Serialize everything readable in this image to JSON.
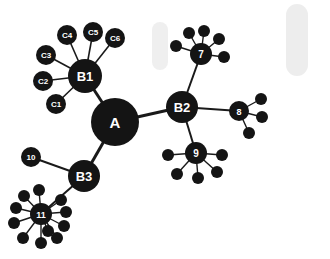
{
  "diagram": {
    "background_color": "#ffffff",
    "node_color": "#141414",
    "edge_color": "#1a1a1a",
    "label_color": "#ffffff"
  },
  "chart_data": {
    "type": "scatter",
    "title": "",
    "xlabel": "",
    "ylabel": "",
    "layout": "radial force-directed tree",
    "grid": false,
    "legend": "none",
    "xlim": [
      0,
      330
    ],
    "ylim": [
      0,
      259
    ],
    "nodes": [
      {
        "id": "A",
        "label": "A",
        "x": 115,
        "y": 122,
        "r": 24,
        "font": 15,
        "kind": "hub"
      },
      {
        "id": "B1",
        "label": "B1",
        "x": 85,
        "y": 76,
        "r": 17,
        "font": 13,
        "kind": "branch"
      },
      {
        "id": "B2",
        "label": "B2",
        "x": 182,
        "y": 107,
        "r": 16,
        "font": 13,
        "kind": "branch"
      },
      {
        "id": "B3",
        "label": "B3",
        "x": 84,
        "y": 176,
        "r": 16,
        "font": 13,
        "kind": "branch"
      },
      {
        "id": "C1",
        "label": "C1",
        "x": 56,
        "y": 104,
        "r": 10,
        "font": 8,
        "kind": "leaf-labeled"
      },
      {
        "id": "C2",
        "label": "C2",
        "x": 43,
        "y": 81,
        "r": 10,
        "font": 8,
        "kind": "leaf-labeled"
      },
      {
        "id": "C3",
        "label": "C3",
        "x": 46,
        "y": 55,
        "r": 10,
        "font": 8,
        "kind": "leaf-labeled"
      },
      {
        "id": "C4",
        "label": "C4",
        "x": 67,
        "y": 35,
        "r": 10,
        "font": 8,
        "kind": "leaf-labeled"
      },
      {
        "id": "C5",
        "label": "C5",
        "x": 93,
        "y": 32,
        "r": 10,
        "font": 8,
        "kind": "leaf-labeled"
      },
      {
        "id": "C6",
        "label": "C6",
        "x": 115,
        "y": 38,
        "r": 10,
        "font": 8,
        "kind": "leaf-labeled"
      },
      {
        "id": "N7",
        "label": "7",
        "x": 201,
        "y": 54,
        "r": 11,
        "font": 10,
        "kind": "leaf-labeled"
      },
      {
        "id": "N8",
        "label": "8",
        "x": 239,
        "y": 111,
        "r": 10,
        "font": 9,
        "kind": "leaf-labeled"
      },
      {
        "id": "N9",
        "label": "9",
        "x": 196,
        "y": 153,
        "r": 11,
        "font": 10,
        "kind": "leaf-labeled"
      },
      {
        "id": "N10",
        "label": "10",
        "x": 31,
        "y": 157,
        "r": 10,
        "font": 8,
        "kind": "leaf-labeled"
      },
      {
        "id": "N11",
        "label": "11",
        "x": 41,
        "y": 214,
        "r": 11,
        "font": 9,
        "kind": "leaf-labeled"
      },
      {
        "id": "L7a",
        "label": "",
        "x": 189,
        "y": 33,
        "r": 6,
        "font": 0,
        "kind": "leaf-dot"
      },
      {
        "id": "L7b",
        "label": "",
        "x": 204,
        "y": 31,
        "r": 6,
        "font": 0,
        "kind": "leaf-dot"
      },
      {
        "id": "L7c",
        "label": "",
        "x": 219,
        "y": 39,
        "r": 6,
        "font": 0,
        "kind": "leaf-dot"
      },
      {
        "id": "L7d",
        "label": "",
        "x": 176,
        "y": 46,
        "r": 6,
        "font": 0,
        "kind": "leaf-dot"
      },
      {
        "id": "L7e",
        "label": "",
        "x": 224,
        "y": 57,
        "r": 6,
        "font": 0,
        "kind": "leaf-dot"
      },
      {
        "id": "L8a",
        "label": "",
        "x": 261,
        "y": 99,
        "r": 6,
        "font": 0,
        "kind": "leaf-dot"
      },
      {
        "id": "L8b",
        "label": "",
        "x": 262,
        "y": 117,
        "r": 6,
        "font": 0,
        "kind": "leaf-dot"
      },
      {
        "id": "L8c",
        "label": "",
        "x": 249,
        "y": 133,
        "r": 6,
        "font": 0,
        "kind": "leaf-dot"
      },
      {
        "id": "L9a",
        "label": "",
        "x": 168,
        "y": 155,
        "r": 6,
        "font": 0,
        "kind": "leaf-dot"
      },
      {
        "id": "L9b",
        "label": "",
        "x": 222,
        "y": 155,
        "r": 6,
        "font": 0,
        "kind": "leaf-dot"
      },
      {
        "id": "L9c",
        "label": "",
        "x": 177,
        "y": 174,
        "r": 6,
        "font": 0,
        "kind": "leaf-dot"
      },
      {
        "id": "L9d",
        "label": "",
        "x": 198,
        "y": 178,
        "r": 6,
        "font": 0,
        "kind": "leaf-dot"
      },
      {
        "id": "L9e",
        "label": "",
        "x": 217,
        "y": 172,
        "r": 6,
        "font": 0,
        "kind": "leaf-dot"
      },
      {
        "id": "L11a",
        "label": "",
        "x": 24,
        "y": 196,
        "r": 6,
        "font": 0,
        "kind": "leaf-dot"
      },
      {
        "id": "L11b",
        "label": "",
        "x": 39,
        "y": 190,
        "r": 6,
        "font": 0,
        "kind": "leaf-dot"
      },
      {
        "id": "L11c",
        "label": "",
        "x": 16,
        "y": 208,
        "r": 6,
        "font": 0,
        "kind": "leaf-dot"
      },
      {
        "id": "L11d",
        "label": "",
        "x": 14,
        "y": 223,
        "r": 6,
        "font": 0,
        "kind": "leaf-dot"
      },
      {
        "id": "L11e",
        "label": "",
        "x": 23,
        "y": 238,
        "r": 6,
        "font": 0,
        "kind": "leaf-dot"
      },
      {
        "id": "L11f",
        "label": "",
        "x": 41,
        "y": 243,
        "r": 6,
        "font": 0,
        "kind": "leaf-dot"
      },
      {
        "id": "L11g",
        "label": "",
        "x": 57,
        "y": 238,
        "r": 6,
        "font": 0,
        "kind": "leaf-dot"
      },
      {
        "id": "L11h",
        "label": "",
        "x": 64,
        "y": 226,
        "r": 6,
        "font": 0,
        "kind": "leaf-dot"
      },
      {
        "id": "L11i",
        "label": "",
        "x": 66,
        "y": 212,
        "r": 6,
        "font": 0,
        "kind": "leaf-dot"
      },
      {
        "id": "L11j",
        "label": "",
        "x": 61,
        "y": 200,
        "r": 6,
        "font": 0,
        "kind": "leaf-dot"
      },
      {
        "id": "L11k",
        "label": "",
        "x": 48,
        "y": 231,
        "r": 6,
        "font": 0,
        "kind": "leaf-dot"
      }
    ],
    "edges": [
      {
        "source": "A",
        "target": "B1",
        "width": 3
      },
      {
        "source": "A",
        "target": "B2",
        "width": 3
      },
      {
        "source": "A",
        "target": "B3",
        "width": 3
      },
      {
        "source": "B1",
        "target": "C1",
        "width": 1.6
      },
      {
        "source": "B1",
        "target": "C2",
        "width": 1.6
      },
      {
        "source": "B1",
        "target": "C3",
        "width": 1.6
      },
      {
        "source": "B1",
        "target": "C4",
        "width": 1.6
      },
      {
        "source": "B1",
        "target": "C5",
        "width": 1.6
      },
      {
        "source": "B1",
        "target": "C6",
        "width": 1.6
      },
      {
        "source": "B2",
        "target": "N7",
        "width": 2
      },
      {
        "source": "B2",
        "target": "N8",
        "width": 2
      },
      {
        "source": "B2",
        "target": "N9",
        "width": 2
      },
      {
        "source": "B3",
        "target": "N10",
        "width": 2
      },
      {
        "source": "B3",
        "target": "N11",
        "width": 2
      },
      {
        "source": "N7",
        "target": "L7a",
        "width": 1.4
      },
      {
        "source": "N7",
        "target": "L7b",
        "width": 1.4
      },
      {
        "source": "N7",
        "target": "L7c",
        "width": 1.4
      },
      {
        "source": "N7",
        "target": "L7d",
        "width": 1.4
      },
      {
        "source": "N7",
        "target": "L7e",
        "width": 1.4
      },
      {
        "source": "N8",
        "target": "L8a",
        "width": 1.4
      },
      {
        "source": "N8",
        "target": "L8b",
        "width": 1.4
      },
      {
        "source": "N8",
        "target": "L8c",
        "width": 1.4
      },
      {
        "source": "N9",
        "target": "L9a",
        "width": 1.4
      },
      {
        "source": "N9",
        "target": "L9b",
        "width": 1.4
      },
      {
        "source": "N9",
        "target": "L9c",
        "width": 1.4
      },
      {
        "source": "N9",
        "target": "L9d",
        "width": 1.4
      },
      {
        "source": "N9",
        "target": "L9e",
        "width": 1.4
      },
      {
        "source": "N11",
        "target": "L11a",
        "width": 1.4
      },
      {
        "source": "N11",
        "target": "L11b",
        "width": 1.4
      },
      {
        "source": "N11",
        "target": "L11c",
        "width": 1.4
      },
      {
        "source": "N11",
        "target": "L11d",
        "width": 1.4
      },
      {
        "source": "N11",
        "target": "L11e",
        "width": 1.4
      },
      {
        "source": "N11",
        "target": "L11f",
        "width": 1.4
      },
      {
        "source": "N11",
        "target": "L11g",
        "width": 1.4
      },
      {
        "source": "N11",
        "target": "L11h",
        "width": 1.4
      },
      {
        "source": "N11",
        "target": "L11i",
        "width": 1.4
      },
      {
        "source": "N11",
        "target": "L11j",
        "width": 1.4
      },
      {
        "source": "N11",
        "target": "L11k",
        "width": 1.4
      }
    ],
    "artifacts": [
      {
        "id": "smudge-left",
        "x": 152,
        "y": 22,
        "width": 16,
        "height": 48,
        "color": "#c9c9c9"
      },
      {
        "id": "smudge-right",
        "x": 286,
        "y": 4,
        "width": 22,
        "height": 72,
        "color": "#c4c4c4"
      }
    ]
  }
}
